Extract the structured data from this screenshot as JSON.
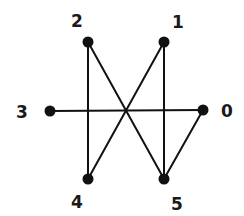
{
  "graph": {
    "nodes": [
      {
        "id": "0",
        "label": "0",
        "x": 203,
        "y": 110,
        "lx": 227,
        "ly": 111
      },
      {
        "id": "1",
        "label": "1",
        "x": 164,
        "y": 42,
        "lx": 178,
        "ly": 22
      },
      {
        "id": "2",
        "label": "2",
        "x": 88,
        "y": 42,
        "lx": 77,
        "ly": 21
      },
      {
        "id": "3",
        "label": "3",
        "x": 50,
        "y": 111,
        "lx": 22,
        "ly": 112
      },
      {
        "id": "4",
        "label": "4",
        "x": 88,
        "y": 179,
        "lx": 77,
        "ly": 202
      },
      {
        "id": "5",
        "label": "5",
        "x": 164,
        "y": 179,
        "lx": 177,
        "ly": 204
      }
    ],
    "edges": [
      [
        "3",
        "0"
      ],
      [
        "2",
        "4"
      ],
      [
        "1",
        "5"
      ],
      [
        "2",
        "5"
      ],
      [
        "1",
        "4"
      ],
      [
        "0",
        "5"
      ]
    ],
    "colors": {
      "stroke": "#111111",
      "node": "#111111",
      "label": "#1a1a1a",
      "background": "#ffffff"
    }
  }
}
